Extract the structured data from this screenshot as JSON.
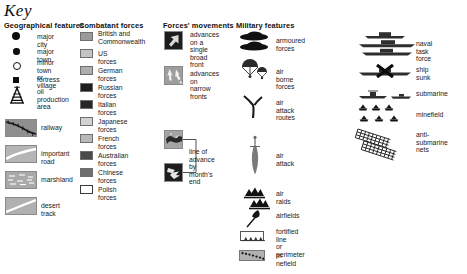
{
  "title": "Key",
  "columns": {
    "geographical": {
      "header": "Geographical features",
      "items": [
        {
          "icon": "filled-circle-large-icon",
          "label": "major city"
        },
        {
          "icon": "filled-circle-small-icon",
          "label": "major town"
        },
        {
          "icon": "open-circle-icon",
          "label": "minor town\nor village"
        },
        {
          "icon": "filled-square-icon",
          "label": "fortress"
        },
        {
          "icon": "oil-derrick-icon",
          "label": "oil production\narea"
        },
        {
          "icon": "railway-swatch-icon",
          "label": "railway"
        },
        {
          "icon": "important-road-swatch-icon",
          "label": "important road"
        },
        {
          "icon": "marshland-swatch-icon",
          "label": "marshland"
        },
        {
          "icon": "desert-track-swatch-icon",
          "label": "desert track"
        }
      ]
    },
    "combatant": {
      "header": "Combatant forces",
      "items": [
        {
          "label": "British and\nCommonwealth",
          "color": "#9a9a9a"
        },
        {
          "label": "US forces",
          "color": "#c3c3c3"
        },
        {
          "label": "German forces",
          "color": "#aeaeae"
        },
        {
          "label": "Russian forces",
          "color": "#1d1d1d"
        },
        {
          "label": "Italian forces",
          "color": "#262626"
        },
        {
          "label": "Japanese forces",
          "color": "#d2d2d2"
        },
        {
          "label": "French forces",
          "color": "#b9b9b9"
        },
        {
          "label": "Australian forces",
          "color": "#4a4a4a"
        },
        {
          "label": "Chinese forces",
          "color": "#6e6e6e"
        },
        {
          "label": "Polish forces",
          "color": "#ffffff"
        }
      ]
    },
    "movements": {
      "header": "Forces' movements",
      "items": [
        {
          "icon": "broad-arrow-icon",
          "label": "advances on a\nsingle broad\nfront"
        },
        {
          "icon": "narrow-arrows-icon",
          "label": "advances on\nnarrow fronts"
        }
      ],
      "bracketed": {
        "label": "line of advance\nby month's end",
        "icons": [
          "line-of-advance-light-icon",
          "line-of-advance-dark-icon"
        ]
      }
    },
    "military": {
      "header": "Military features",
      "items": [
        {
          "icon": "armoured-forces-icon",
          "label": "armoured forces"
        },
        {
          "icon": "airborne-forces-icon",
          "label": "air borne forces"
        },
        {
          "icon": "air-attack-routes-icon",
          "label": "air attack\nroutes"
        },
        {
          "icon": "air-attack-icon",
          "label": "air attack"
        },
        {
          "icon": "air-raids-icon",
          "label": "air raids"
        },
        {
          "icon": "airfields-icon",
          "label": "airfields"
        },
        {
          "icon": "fortified-line-icon",
          "label": "fortified line\nor perimeter"
        },
        {
          "icon": "minefield-box-icon",
          "label": "m nefield"
        }
      ]
    },
    "naval": {
      "header": "",
      "items": [
        {
          "icon": "naval-task-force-icon",
          "label": "naval task force"
        },
        {
          "icon": "ship-sunk-icon",
          "label": "ship sunk"
        },
        {
          "icon": "submarine-icon",
          "label": "submarine"
        },
        {
          "icon": "minefield-stars-icon",
          "label": "minefield"
        },
        {
          "icon": "anti-submarine-nets-icon",
          "label": "anti-submarine\nnets"
        }
      ]
    }
  }
}
